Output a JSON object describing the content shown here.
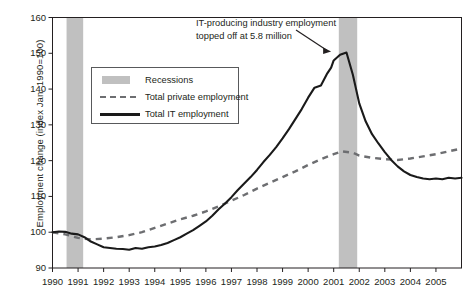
{
  "chart_data": {
    "type": "line",
    "title": "",
    "xlabel": "",
    "ylabel": "Employment change (index Jan. 1990=100)",
    "xlim": [
      1990,
      2006
    ],
    "ylim": [
      90,
      160
    ],
    "yticks": [
      90,
      100,
      110,
      120,
      130,
      140,
      150,
      160
    ],
    "xticks": [
      1990,
      1991,
      1992,
      1993,
      1994,
      1995,
      1996,
      1997,
      1998,
      1999,
      2000,
      2001,
      2002,
      2003,
      2004,
      2005
    ],
    "grid": false,
    "legend_position": "upper-left-inside",
    "legend": [
      {
        "key": "recessions",
        "label": "Recessions",
        "style": "band",
        "color": "#c0c0c0"
      },
      {
        "key": "private",
        "label": "Total private employment",
        "style": "dashed",
        "color": "#6d6e71"
      },
      {
        "key": "it",
        "label": "Total IT employment",
        "style": "solid",
        "color": "#1a1a1a"
      }
    ],
    "annotations": [
      {
        "line1": "IT-producing industry employment",
        "line2": "topped off at 5.8 million",
        "points_to_x": 2000.9,
        "points_to_y": 150.2
      }
    ],
    "shaded_regions": [
      {
        "name": "recession-1990-1991",
        "x0": 1990.55,
        "x1": 1991.2,
        "color": "#c0c0c0"
      },
      {
        "name": "recession-2001",
        "x0": 2001.2,
        "x1": 2001.92,
        "color": "#c0c0c0"
      }
    ],
    "series": [
      {
        "name": "Total IT employment",
        "style": "solid",
        "color": "#1a1a1a",
        "x": [
          1990.0,
          1990.25,
          1990.5,
          1990.75,
          1991.0,
          1991.25,
          1991.5,
          1991.75,
          1992.0,
          1992.25,
          1992.5,
          1992.75,
          1993.0,
          1993.25,
          1993.5,
          1993.75,
          1994.0,
          1994.25,
          1994.5,
          1994.75,
          1995.0,
          1995.25,
          1995.5,
          1995.75,
          1996.0,
          1996.25,
          1996.5,
          1996.75,
          1997.0,
          1997.25,
          1997.5,
          1997.75,
          1998.0,
          1998.25,
          1998.5,
          1998.75,
          1999.0,
          1999.25,
          1999.5,
          1999.75,
          2000.0,
          2000.25,
          2000.5,
          2000.75,
          2000.9,
          2001.0,
          2001.25,
          2001.5,
          2001.75,
          2002.0,
          2002.25,
          2002.5,
          2002.75,
          2003.0,
          2003.25,
          2003.5,
          2003.75,
          2004.0,
          2004.25,
          2004.5,
          2004.75,
          2005.0,
          2005.25,
          2005.5,
          2005.75,
          2006.0
        ],
        "y": [
          100.0,
          100.2,
          100.1,
          99.6,
          99.4,
          98.6,
          97.4,
          96.6,
          95.8,
          95.6,
          95.4,
          95.3,
          95.1,
          95.6,
          95.4,
          95.8,
          96.0,
          96.4,
          97.0,
          97.8,
          98.6,
          99.6,
          100.6,
          101.8,
          103.0,
          104.6,
          106.4,
          108.0,
          109.8,
          111.8,
          113.6,
          115.4,
          117.4,
          119.6,
          121.6,
          123.8,
          126.2,
          128.8,
          131.6,
          134.4,
          137.6,
          140.4,
          141.0,
          144.4,
          146.0,
          148.0,
          149.6,
          150.2,
          144.0,
          136.0,
          131.0,
          127.4,
          124.8,
          122.4,
          120.2,
          118.4,
          117.0,
          116.0,
          115.4,
          115.0,
          114.8,
          115.0,
          114.8,
          115.2,
          115.0,
          115.2
        ]
      },
      {
        "name": "Total private employment",
        "style": "dashed",
        "color": "#6d6e71",
        "x": [
          1990.0,
          1990.5,
          1991.0,
          1991.5,
          1992.0,
          1992.5,
          1993.0,
          1993.5,
          1994.0,
          1994.5,
          1995.0,
          1995.5,
          1996.0,
          1996.5,
          1997.0,
          1997.5,
          1998.0,
          1998.5,
          1999.0,
          1999.5,
          2000.0,
          2000.5,
          2001.0,
          2001.3,
          2001.75,
          2002.0,
          2002.5,
          2003.0,
          2003.5,
          2004.0,
          2004.5,
          2005.0,
          2005.5,
          2006.0
        ],
        "y": [
          100.0,
          99.4,
          98.4,
          98.0,
          98.2,
          98.6,
          99.2,
          100.0,
          101.2,
          102.4,
          103.6,
          104.6,
          105.8,
          107.2,
          108.8,
          110.4,
          112.2,
          113.8,
          115.4,
          117.0,
          118.8,
          120.4,
          121.8,
          122.6,
          122.2,
          121.4,
          120.8,
          120.4,
          120.2,
          120.6,
          121.2,
          121.8,
          122.6,
          123.4
        ]
      }
    ]
  }
}
